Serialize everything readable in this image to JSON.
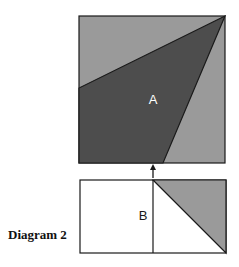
{
  "caption": "Diagram 2",
  "top_square": {
    "label": "A",
    "colors": {
      "light": "#9a9a9a",
      "dark": "#4d4d4d",
      "stroke": "#1a1a1a",
      "label": "#ffffff"
    }
  },
  "bottom_rect": {
    "label": "B",
    "colors": {
      "fill": "#ffffff",
      "shaded": "#9a9a9a",
      "stroke": "#1a1a1a"
    }
  },
  "arrow": "up-arrow"
}
